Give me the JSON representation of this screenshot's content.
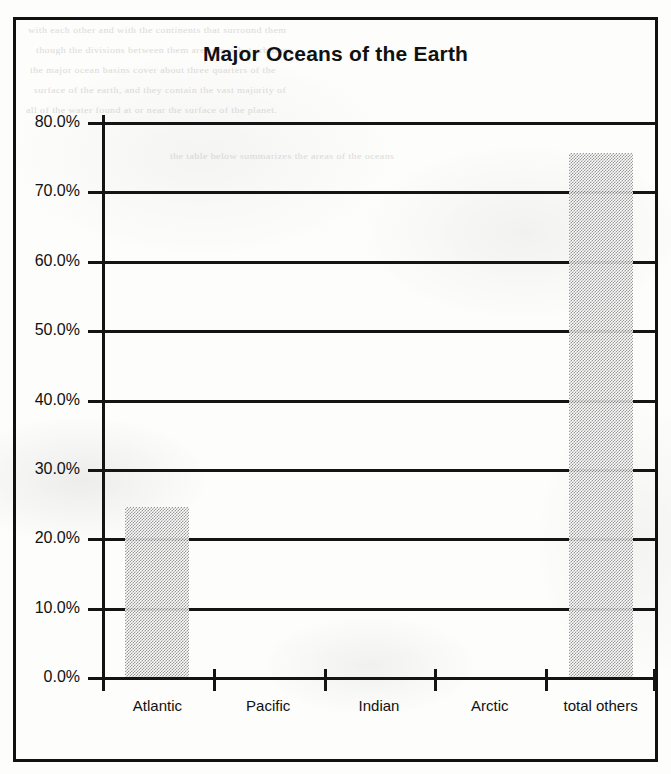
{
  "document": {
    "background_texture": "scanned-paper",
    "bleed_through_lines": [
      "with each other and with the continents that surround them",
      "though the divisions between them are somewhat arbitrary",
      "the major ocean basins cover about three quarters of the",
      "surface of the earth, and they contain the vast majority of",
      "all of the water found at or near the surface of the planet.",
      "the table below summarizes the areas of the oceans"
    ]
  },
  "chart": {
    "title": "Major Oceans of the Earth",
    "frame_color": "#111111",
    "bar_fill": "#8e8e8e",
    "bar_pattern": "50% checkerboard dither"
  },
  "chart_data": {
    "type": "bar",
    "title": "Major Oceans of the Earth",
    "xlabel": "",
    "ylabel": "",
    "categories": [
      "Atlantic",
      "Pacific",
      "Indian",
      "Arctic",
      "total others"
    ],
    "values": [
      24.5,
      0,
      0,
      0,
      75.6
    ],
    "value_labels": [
      "24.5%",
      "0.0%",
      "0.0%",
      "0.0%",
      "75.6%"
    ],
    "ylim": [
      0,
      80
    ],
    "ytick_values": [
      0,
      10,
      20,
      30,
      40,
      50,
      60,
      70,
      80
    ],
    "ytick_labels": [
      "0.0%",
      "10.0%",
      "20.0%",
      "30.0%",
      "40.0%",
      "50.0%",
      "60.0%",
      "70.0%",
      "80.0%"
    ],
    "grid": true,
    "grid_axis": "y",
    "legend": false,
    "legend_position": "none",
    "series": [
      {
        "name": "share of ocean area",
        "values": [
          24.5,
          0,
          0,
          0,
          75.6
        ]
      }
    ]
  }
}
